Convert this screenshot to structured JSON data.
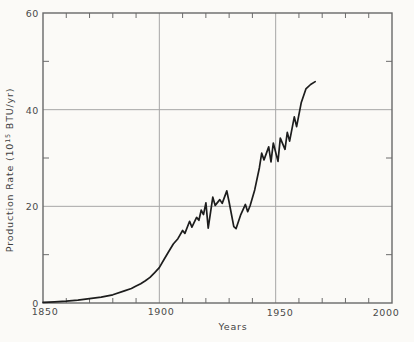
{
  "page": {
    "background_color": "#fbfaf7"
  },
  "chart_data": {
    "type": "line",
    "title": "",
    "xlabel": "Years",
    "ylabel": "Production Rate (10^15 BTU/yr)",
    "ylabel_parts": {
      "prefix": "Production Rate (10",
      "superscript": "15",
      "suffix": " BTU/yr)"
    },
    "xlim": [
      1850,
      2000
    ],
    "ylim": [
      0,
      60
    ],
    "x_tick_labels": [
      "1850",
      "1900",
      "1950",
      "2000"
    ],
    "y_tick_labels": [
      "0",
      "20",
      "40",
      "60"
    ],
    "x_major_ticks": [
      1850,
      1900,
      1950,
      2000
    ],
    "y_major_ticks": [
      0,
      20,
      40,
      60
    ],
    "minor_tick_interval_x": 10,
    "minor_tick_interval_y": 10,
    "gridlines_x": [
      1900,
      1950
    ],
    "gridlines_y": [
      20,
      40
    ],
    "grid": "major-on",
    "legend": "none",
    "colors": {
      "line": "#1d1d1d",
      "grid": "#a6a6a6",
      "axis": "#686868",
      "tick": "#6c6c6c",
      "text": "#4a4a4a"
    },
    "series": [
      {
        "name": "Energy production rate",
        "points": [
          [
            1850,
            0.15
          ],
          [
            1855,
            0.25
          ],
          [
            1860,
            0.4
          ],
          [
            1865,
            0.6
          ],
          [
            1870,
            0.9
          ],
          [
            1875,
            1.2
          ],
          [
            1880,
            1.7
          ],
          [
            1885,
            2.5
          ],
          [
            1888,
            3.0
          ],
          [
            1890,
            3.5
          ],
          [
            1892,
            4.0
          ],
          [
            1894,
            4.6
          ],
          [
            1896,
            5.3
          ],
          [
            1898,
            6.3
          ],
          [
            1900,
            7.3
          ],
          [
            1902,
            9.0
          ],
          [
            1904,
            10.6
          ],
          [
            1906,
            12.2
          ],
          [
            1908,
            13.3
          ],
          [
            1910,
            15.0
          ],
          [
            1911,
            14.4
          ],
          [
            1913,
            16.9
          ],
          [
            1914,
            15.7
          ],
          [
            1916,
            17.7
          ],
          [
            1917,
            17.1
          ],
          [
            1918,
            19.2
          ],
          [
            1919,
            18.3
          ],
          [
            1920,
            20.7
          ],
          [
            1921,
            15.5
          ],
          [
            1923,
            21.9
          ],
          [
            1924,
            20.2
          ],
          [
            1926,
            21.4
          ],
          [
            1927,
            20.6
          ],
          [
            1929,
            23.2
          ],
          [
            1930,
            20.9
          ],
          [
            1932,
            15.8
          ],
          [
            1933,
            15.4
          ],
          [
            1935,
            18.3
          ],
          [
            1937,
            20.4
          ],
          [
            1938,
            18.9
          ],
          [
            1939,
            20.1
          ],
          [
            1941,
            23.4
          ],
          [
            1943,
            28.0
          ],
          [
            1944,
            31.0
          ],
          [
            1945,
            29.6
          ],
          [
            1947,
            32.3
          ],
          [
            1948,
            29.2
          ],
          [
            1949,
            33.1
          ],
          [
            1951,
            29.3
          ],
          [
            1952,
            34.1
          ],
          [
            1954,
            31.8
          ],
          [
            1955,
            35.3
          ],
          [
            1956,
            33.5
          ],
          [
            1958,
            38.5
          ],
          [
            1959,
            36.5
          ],
          [
            1961,
            41.5
          ],
          [
            1963,
            44.3
          ],
          [
            1965,
            45.2
          ],
          [
            1967,
            45.8
          ]
        ]
      }
    ]
  }
}
